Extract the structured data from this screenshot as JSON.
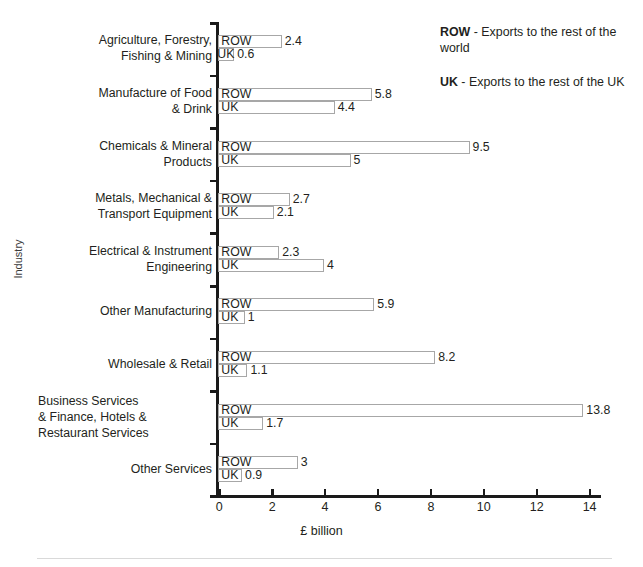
{
  "chart_data": {
    "type": "bar",
    "orientation": "horizontal",
    "title": "",
    "xlabel": "£ billion",
    "ylabel": "Industry",
    "xlim": [
      0,
      14.6
    ],
    "xticks": [
      0,
      2,
      4,
      6,
      8,
      10,
      12,
      14
    ],
    "xticklabels": [
      "0",
      "2",
      "4",
      "6",
      "8",
      "10",
      "12",
      "14"
    ],
    "grid": false,
    "legend_position": "top-right",
    "categories": [
      "Agriculture, Forestry,\nFishing & Mining",
      "Manufacture of Food\n& Drink",
      "Chemicals & Mineral\nProducts",
      "Metals, Mechanical &\nTransport Equipment",
      "Electrical & Instrument\nEngineering",
      "Other Manufacturing",
      "Wholesale & Retail",
      "Business Services\n& Finance, Hotels &\nRestaurant Services",
      "Other Services"
    ],
    "series": [
      {
        "name": "ROW",
        "values": [
          2.4,
          5.8,
          9.5,
          2.7,
          2.3,
          5.9,
          8.2,
          13.8,
          3
        ]
      },
      {
        "name": "UK",
        "values": [
          0.6,
          4.4,
          5,
          2.1,
          4,
          1,
          1.1,
          1.7,
          0.9
        ]
      }
    ],
    "value_labels": {
      "ROW": [
        "2.4",
        "5.8",
        "9.5",
        "2.7",
        "2.3",
        "5.9",
        "8.2",
        "13.8",
        "3"
      ],
      "UK": [
        "0.6",
        "4.4",
        "5",
        "2.1",
        "4",
        "1",
        "1.1",
        "1.7",
        "0.9"
      ]
    },
    "bar_fill": "#ffffff",
    "bar_border": "#a7a7a7",
    "axis_color": "#1a1a1a",
    "text_color": "#231f20"
  },
  "legend": {
    "entries": [
      {
        "key": "ROW",
        "description": " - Exports to the rest of the world"
      },
      {
        "key": "UK",
        "description": " - Exports to the rest of the UK"
      }
    ]
  },
  "footer": {
    "caption": ""
  }
}
